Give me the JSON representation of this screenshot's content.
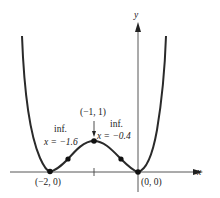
{
  "figure": {
    "function_description": "quartic with local minima at (-2,0) and (0,0), local maximum at (-1,1)",
    "axes": {
      "x_label": "x",
      "y_label": "y"
    },
    "points": [
      {
        "name": "min-left",
        "label": "(−2, 0)"
      },
      {
        "name": "max",
        "label": "(−1, 1)"
      },
      {
        "name": "min-right",
        "label": "(0, 0)"
      }
    ],
    "inflection_labels": {
      "left": {
        "line1": "inf.",
        "line2": "x = −1.6"
      },
      "right": {
        "line1": "inf.",
        "line2": "x = −0.4"
      }
    },
    "colors": {
      "curve": "#2a2a2a",
      "axis": "#444444",
      "text": "#222222"
    }
  }
}
